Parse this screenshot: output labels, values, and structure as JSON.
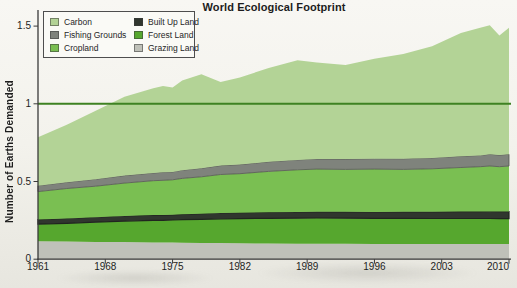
{
  "title": "World Ecological Footprint",
  "y_axis": {
    "label": "Number of Earths Demanded",
    "tick_values": [
      0,
      0.5,
      1,
      1.5
    ],
    "tick_labels": [
      "0",
      "0.5",
      "1",
      "1.5"
    ]
  },
  "x_axis": {
    "tick_years": [
      1961,
      1968,
      1975,
      1982,
      1989,
      1996,
      2003,
      2010
    ]
  },
  "colors": {
    "carbon": "#b3d396",
    "fishing_grounds": "#7f837c",
    "cropland": "#7abf52",
    "built_up_land": "#30362e",
    "forest_land": "#56a72e",
    "grazing_land": "#bfc1b9",
    "reference_line": "#3e8222",
    "axis": "#3a3a3a"
  },
  "legend": {
    "items": [
      {
        "label": "Carbon",
        "color": "carbon"
      },
      {
        "label": "Fishing Grounds",
        "color": "fishing_grounds"
      },
      {
        "label": "Cropland",
        "color": "cropland"
      },
      {
        "label": "Built Up Land",
        "color": "built_up_land"
      },
      {
        "label": "Forest Land",
        "color": "forest_land"
      },
      {
        "label": "Grazing Land",
        "color": "grazing_land"
      }
    ]
  },
  "chart_data": {
    "type": "area",
    "stacked": true,
    "title": "World Ecological Footprint",
    "xlabel": "",
    "ylabel": "Number of Earths Demanded",
    "ylim": [
      0,
      1.5
    ],
    "xlim": [
      1961,
      2010
    ],
    "grid": false,
    "legend_position": "top-left",
    "reference_line": {
      "value": 1.0,
      "color": "reference_line",
      "meaning": "one Earth"
    },
    "x": [
      1961,
      1964,
      1967,
      1970,
      1973,
      1974,
      1975,
      1976,
      1978,
      1980,
      1982,
      1985,
      1988,
      1990,
      1993,
      1996,
      1999,
      2002,
      2005,
      2007,
      2008,
      2009,
      2010
    ],
    "series": [
      {
        "name": "Grazing Land",
        "color": "grazing_land",
        "values": [
          0.115,
          0.113,
          0.111,
          0.11,
          0.108,
          0.107,
          0.107,
          0.106,
          0.105,
          0.104,
          0.102,
          0.101,
          0.1,
          0.1,
          0.099,
          0.098,
          0.098,
          0.098,
          0.098,
          0.098,
          0.098,
          0.097,
          0.097
        ]
      },
      {
        "name": "Forest Land",
        "color": "forest_land",
        "values": [
          0.11,
          0.118,
          0.127,
          0.135,
          0.142,
          0.143,
          0.145,
          0.148,
          0.152,
          0.156,
          0.159,
          0.162,
          0.164,
          0.165,
          0.165,
          0.165,
          0.165,
          0.164,
          0.164,
          0.164,
          0.164,
          0.164,
          0.164
        ]
      },
      {
        "name": "Built Up Land",
        "color": "built_up_land",
        "edge": "#20251f",
        "edge_width": 1.2,
        "values": [
          0.03,
          0.031,
          0.032,
          0.033,
          0.034,
          0.034,
          0.034,
          0.035,
          0.036,
          0.037,
          0.038,
          0.039,
          0.04,
          0.04,
          0.041,
          0.041,
          0.042,
          0.043,
          0.044,
          0.044,
          0.045,
          0.045,
          0.045
        ]
      },
      {
        "name": "Cropland",
        "color": "cropland",
        "values": [
          0.18,
          0.193,
          0.2,
          0.212,
          0.221,
          0.224,
          0.225,
          0.231,
          0.237,
          0.248,
          0.251,
          0.263,
          0.271,
          0.275,
          0.273,
          0.276,
          0.273,
          0.277,
          0.284,
          0.289,
          0.293,
          0.289,
          0.294
        ]
      },
      {
        "name": "Fishing Grounds",
        "color": "fishing_grounds",
        "edge": "#53574f",
        "edge_width": 0.8,
        "values": [
          0.038,
          0.04,
          0.045,
          0.048,
          0.05,
          0.051,
          0.051,
          0.053,
          0.055,
          0.057,
          0.059,
          0.062,
          0.064,
          0.065,
          0.066,
          0.067,
          0.068,
          0.07,
          0.072,
          0.073,
          0.075,
          0.075,
          0.075
        ]
      },
      {
        "name": "Carbon",
        "color": "carbon",
        "values": [
          0.312,
          0.37,
          0.44,
          0.507,
          0.545,
          0.556,
          0.543,
          0.577,
          0.605,
          0.538,
          0.561,
          0.603,
          0.641,
          0.62,
          0.606,
          0.643,
          0.674,
          0.718,
          0.793,
          0.822,
          0.83,
          0.77,
          0.815
        ]
      }
    ],
    "totals_by_year_sample": {
      "1961": 0.78,
      "1970": 1.05,
      "1978": 1.19,
      "1988": 1.28,
      "2000": 1.33,
      "2008": 1.5,
      "2009": 1.44,
      "2010": 1.49
    }
  }
}
